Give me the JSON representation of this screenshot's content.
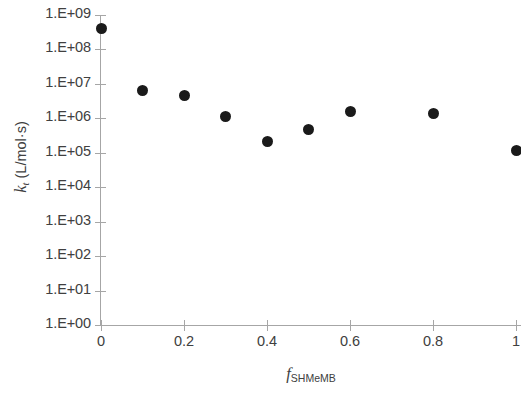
{
  "chart_data": {
    "type": "scatter",
    "title": "",
    "xlabel": "f_SHMeMB",
    "xlabel_base": "f",
    "xlabel_sub": "SHMeMB",
    "ylabel": "k_t (L/mol·s)",
    "ylabel_base": "k",
    "ylabel_sub": "t",
    "ylabel_rest": " (L/mol·s)",
    "x": [
      0,
      0.1,
      0.2,
      0.3,
      0.4,
      0.5,
      0.6,
      0.8,
      1.0
    ],
    "values": [
      400000000,
      6500000,
      4500000,
      1100000,
      210000,
      470000,
      1600000,
      1400000,
      120000
    ],
    "xlim": [
      0,
      1
    ],
    "xticks": [
      0,
      0.2,
      0.4,
      0.6,
      0.8,
      1
    ],
    "xtick_labels": [
      "0",
      "0.2",
      "0.4",
      "0.6",
      "0.8",
      "1"
    ],
    "yscale": "log",
    "ylim": [
      1,
      1000000000
    ],
    "yticks": [
      1,
      10,
      100,
      1000,
      10000,
      100000,
      1000000,
      10000000,
      100000000,
      1000000000
    ],
    "ytick_labels": [
      "1.E+09",
      "1.E+08",
      "1.E+07",
      "1.E+06",
      "1.E+05",
      "1.E+04",
      "1.E+03",
      "1.E+02",
      "1.E+01",
      "1.E+00"
    ],
    "grid": false,
    "legend": null,
    "marker": "filled-circle",
    "marker_color": "#1a1a1a",
    "axis_color": "#a6a6a6",
    "text_color": "#404040",
    "background": "#ffffff"
  }
}
